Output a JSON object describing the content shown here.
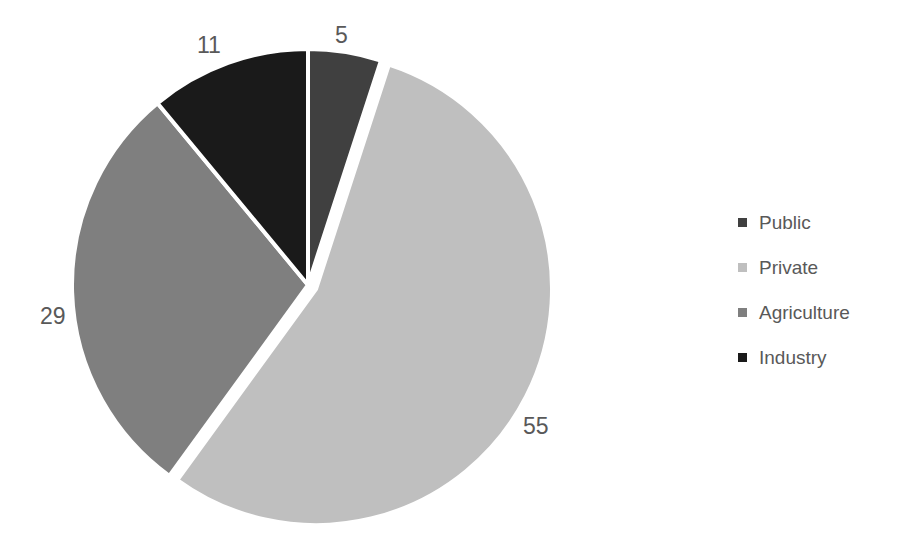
{
  "chart_data": {
    "type": "pie",
    "title": "",
    "categories": [
      "Public",
      "Private",
      "Agriculture",
      "Industry"
    ],
    "values": [
      5,
      55,
      29,
      11
    ],
    "total": 100,
    "start_angle_deg": 0,
    "direction": "clockwise",
    "exploded_slice": "Private",
    "legend_position": "right",
    "grid": false,
    "colors": [
      "#404040",
      "#bfbfbf",
      "#7f7f7f",
      "#1a1a1a"
    ],
    "slice_separator_color": "#ffffff",
    "background_color": "#ffffff",
    "label_color": "#595959",
    "data_labels": [
      "5",
      "55",
      "29",
      "11"
    ]
  },
  "legend": {
    "items": [
      {
        "label": "Public",
        "color": "#404040"
      },
      {
        "label": "Private",
        "color": "#bfbfbf"
      },
      {
        "label": "Agriculture",
        "color": "#7f7f7f"
      },
      {
        "label": "Industry",
        "color": "#1a1a1a"
      }
    ]
  },
  "labels": {
    "public": "5",
    "private": "55",
    "agriculture": "29",
    "industry": "11"
  },
  "geometry": {
    "center_x": 308,
    "center_y": 285,
    "radius": 236,
    "explode_offset": 9
  }
}
